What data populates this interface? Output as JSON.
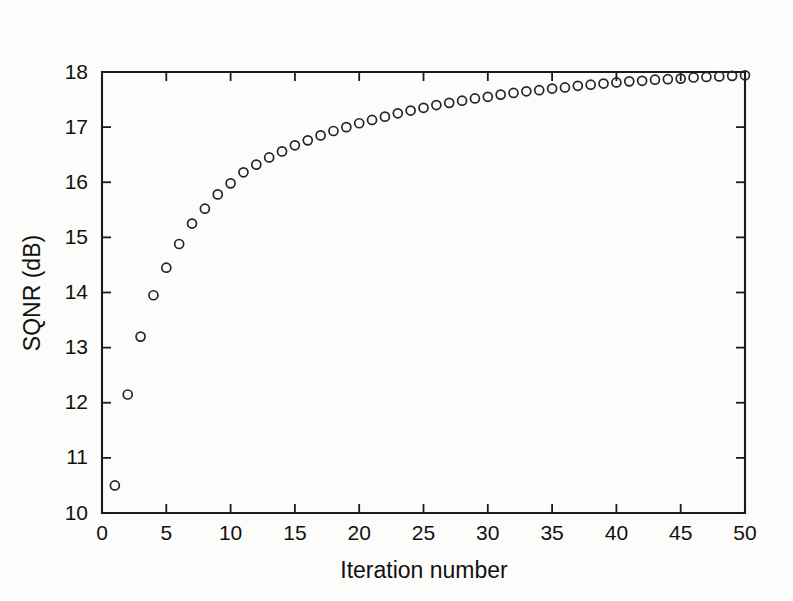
{
  "chart_data": {
    "type": "scatter",
    "title": "",
    "xlabel": "Iteration number",
    "ylabel": "SQNR (dB)",
    "xlim": [
      0,
      50
    ],
    "ylim": [
      10,
      18
    ],
    "xticks": [
      0,
      5,
      10,
      15,
      20,
      25,
      30,
      35,
      40,
      45,
      50
    ],
    "xtick_labels": [
      "0",
      "5",
      "10",
      "15",
      "20",
      "25",
      "30",
      "35",
      "40",
      "45",
      "50"
    ],
    "yticks": [
      10,
      11,
      12,
      13,
      14,
      15,
      16,
      17,
      18
    ],
    "ytick_labels": [
      "10",
      "11",
      "12",
      "13",
      "14",
      "15",
      "16",
      "17",
      "18"
    ],
    "grid": false,
    "legend": null,
    "marker": "open-circle",
    "marker_color": "#252525",
    "marker_size_px": 9,
    "series": [
      {
        "name": "SQNR",
        "x": [
          1,
          2,
          3,
          4,
          5,
          6,
          7,
          8,
          9,
          10,
          11,
          12,
          13,
          14,
          15,
          16,
          17,
          18,
          19,
          20,
          21,
          22,
          23,
          24,
          25,
          26,
          27,
          28,
          29,
          30,
          31,
          32,
          33,
          34,
          35,
          36,
          37,
          38,
          39,
          40,
          41,
          42,
          43,
          44,
          45,
          46,
          47,
          48,
          49,
          50
        ],
        "values": [
          10.5,
          12.15,
          13.2,
          13.95,
          14.45,
          14.88,
          15.25,
          15.52,
          15.78,
          15.98,
          16.18,
          16.32,
          16.45,
          16.56,
          16.67,
          16.76,
          16.85,
          16.93,
          17.0,
          17.07,
          17.13,
          17.19,
          17.25,
          17.3,
          17.35,
          17.4,
          17.44,
          17.48,
          17.52,
          17.55,
          17.59,
          17.62,
          17.65,
          17.67,
          17.7,
          17.72,
          17.75,
          17.77,
          17.79,
          17.81,
          17.83,
          17.84,
          17.86,
          17.87,
          17.88,
          17.9,
          17.91,
          17.92,
          17.93,
          17.94
        ]
      }
    ]
  },
  "figure": {
    "background_color": "#fcfcfa",
    "axis_color": "#1b1b1b"
  }
}
